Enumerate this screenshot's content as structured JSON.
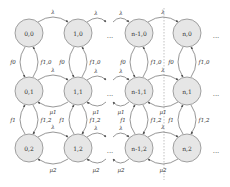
{
  "diagram": {
    "colors": {
      "node_fill": "#e6e6e6",
      "node_stroke": "#8a8a8a",
      "edge": "#6a6a6a"
    },
    "nodes": [
      {
        "id": "0,0",
        "label": "0,0"
      },
      {
        "id": "1,0",
        "label": "1,0"
      },
      {
        "id": "n-1,0",
        "label": "n-1,0"
      },
      {
        "id": "n,0",
        "label": "n,0"
      },
      {
        "id": "0,1",
        "label": "0,1"
      },
      {
        "id": "1,1",
        "label": "1,1"
      },
      {
        "id": "n-1,1",
        "label": "n-1,1"
      },
      {
        "id": "n,1",
        "label": "n,1"
      },
      {
        "id": "0,2",
        "label": "0,2"
      },
      {
        "id": "1,2",
        "label": "1,2"
      },
      {
        "id": "n-1,2",
        "label": "n-1,2"
      },
      {
        "id": "n,2",
        "label": "n,2"
      }
    ],
    "ellipsis": "...",
    "labels": {
      "lambda": "λ",
      "mu1": "μ1",
      "mu2": "μ2",
      "f0": "f0",
      "f10": "f1,0",
      "f1": "f1",
      "f12": "f1,2"
    }
  }
}
